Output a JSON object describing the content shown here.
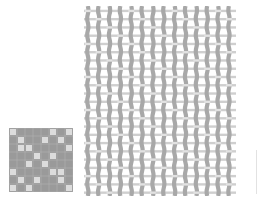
{
  "figure": {
    "type": "weave-diagram",
    "background": "#ffffff",
    "weave_pattern": {
      "description": "Small checkerboard-style weave draft",
      "x": 9,
      "y": 128,
      "size": 64,
      "cells": 8,
      "dark_color": "#9a9a9a",
      "light_color": "#dcdcdc"
    },
    "cloth_simulation": {
      "description": "Woven fabric rendering with wavy vertical warp threads and horizontal weft threads",
      "x": 84,
      "y": 6,
      "width": 150,
      "height": 190,
      "warp_count": 14,
      "weft_count": 23,
      "warp_color": "#a8a8a8",
      "weft_color": "#cfcfcf"
    },
    "divider_line": {
      "x": 256,
      "y": 150,
      "height": 44,
      "color": "#e2e2e2"
    }
  }
}
